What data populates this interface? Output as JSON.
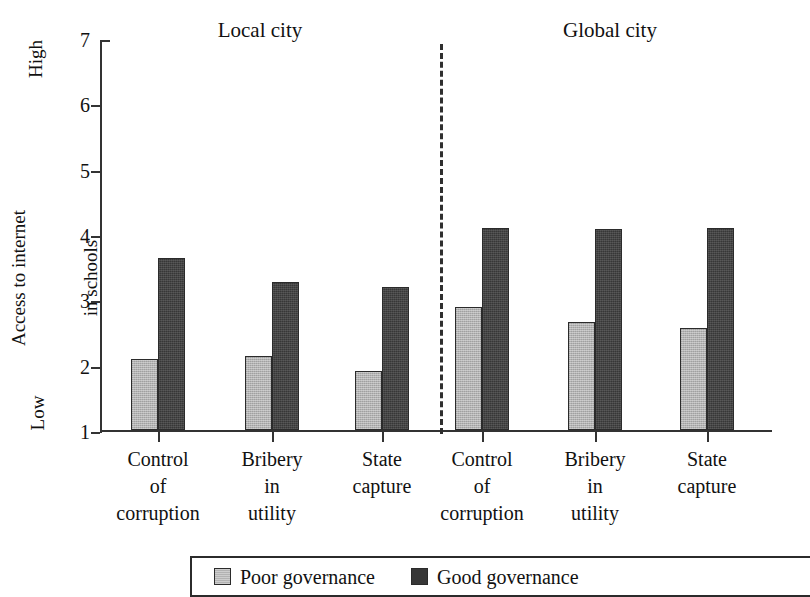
{
  "chart_data": {
    "type": "bar",
    "title": "",
    "xlabel": "",
    "ylabel": "Access to internet in schools",
    "ylim": [
      1,
      7
    ],
    "yticks": [
      1,
      2,
      3,
      4,
      5,
      6,
      7
    ],
    "ytick_labels": [
      "1",
      "2",
      "3",
      "4",
      "5",
      "6",
      "7"
    ],
    "y_scale_low_label": "Low",
    "y_scale_high_label": "High",
    "grid": false,
    "legend_position": "bottom",
    "panels": [
      {
        "name": "Local city",
        "categories": [
          "Control of corruption",
          "Bribery in utility",
          "State capture"
        ],
        "series": [
          {
            "name": "Poor governance",
            "values": [
              2.08,
              2.14,
              1.91
            ]
          },
          {
            "name": "Good governance",
            "values": [
              3.63,
              3.26,
              3.19
            ]
          }
        ]
      },
      {
        "name": "Global city",
        "categories": [
          "Control of corruption",
          "Bribery in utility",
          "State capture"
        ],
        "series": [
          {
            "name": "Poor governance",
            "values": [
              2.89,
              2.66,
              2.56
            ]
          },
          {
            "name": "Good governance",
            "values": [
              4.09,
              4.08,
              4.09
            ]
          }
        ]
      }
    ],
    "series_colors": {
      "Poor governance": "#b2b2b2",
      "Good governance": "#373737"
    }
  },
  "axis": {
    "y_title_line1": "Access to internet",
    "y_title_line2": "in schools",
    "high": "High",
    "low": "Low",
    "ticks": [
      "7",
      "6",
      "5",
      "4",
      "3",
      "2",
      "1"
    ]
  },
  "panels": {
    "local": {
      "title": "Local city"
    },
    "global": {
      "title": "Global city"
    }
  },
  "categories": [
    {
      "line1": "Control",
      "line2": "of",
      "line3": "corruption"
    },
    {
      "line1": "Bribery",
      "line2": "in",
      "line3": "utility"
    },
    {
      "line1": "State",
      "line2": "capture",
      "line3": ""
    }
  ],
  "legend": {
    "items": [
      {
        "label": "Poor governance",
        "color": "#b2b2b2"
      },
      {
        "label": "Good governance",
        "color": "#373737"
      }
    ]
  }
}
